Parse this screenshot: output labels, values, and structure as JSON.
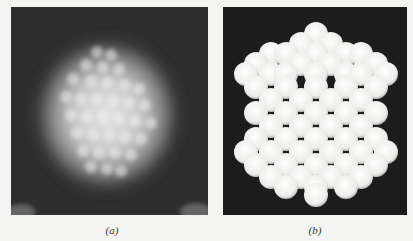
{
  "figure": {
    "panels": [
      {
        "id": "a",
        "label": "(a)",
        "description": "Blurred electron micrograph of a cluster showing bright hexagonal-ish blob of atoms on dark background"
      },
      {
        "id": "b",
        "label": "(b)",
        "description": "Ball model of a polyhedral cluster of close-packed white spheres on black background"
      }
    ],
    "colors": {
      "background": "#f4f4f2",
      "panel_dark": "#262626",
      "sphere": "#f2f2f0"
    }
  }
}
